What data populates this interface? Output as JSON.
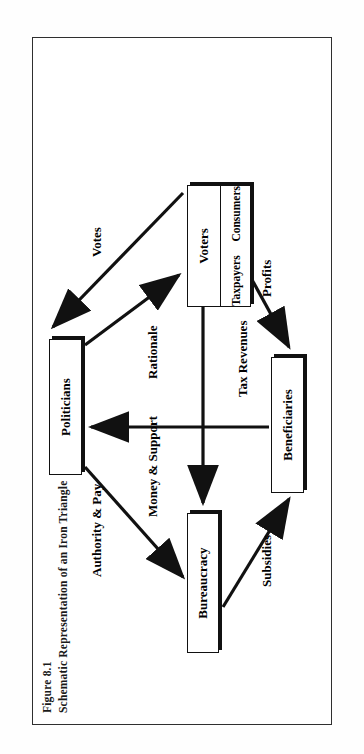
{
  "figure": {
    "number": "Figure 8.1",
    "title": "Schematic Representation of an Iron Triangle"
  },
  "diagram": {
    "type": "iron-triangle",
    "orientation": "page rotated 90 degrees counter-clockwise",
    "nodes": [
      {
        "id": "politicians",
        "label": "Politicians"
      },
      {
        "id": "bureaucracy",
        "label": "Bureaucracy"
      },
      {
        "id": "voters",
        "label": "Voters"
      },
      {
        "id": "taxpayers",
        "label": "Taxpayers"
      },
      {
        "id": "consumers",
        "label": "Consumers"
      },
      {
        "id": "beneficiaries",
        "label": "Beneficiaries"
      }
    ],
    "edges": [
      {
        "id": "authority-pay",
        "label": "Authority & Pay",
        "from": "politicians",
        "to": "bureaucracy"
      },
      {
        "id": "votes",
        "label": "Votes",
        "from": "voters",
        "to": "politicians"
      },
      {
        "id": "money-support",
        "label": "Money & Support",
        "from": "beneficiaries",
        "to": "politicians"
      },
      {
        "id": "rationale",
        "label": "Rationale",
        "from": "politicians",
        "to": "voters"
      },
      {
        "id": "tax-revenues",
        "label": "Tax Revenues",
        "from": "voters",
        "to": "bureaucracy"
      },
      {
        "id": "subsidies",
        "label": "Subsidies",
        "from": "bureaucracy",
        "to": "beneficiaries"
      },
      {
        "id": "profits",
        "label": "Profits",
        "from": "beneficiaries",
        "to": "voters"
      }
    ],
    "colors": {
      "ink": "#111111",
      "frame": "#2f2f2f",
      "paper": "#ffffff"
    }
  }
}
